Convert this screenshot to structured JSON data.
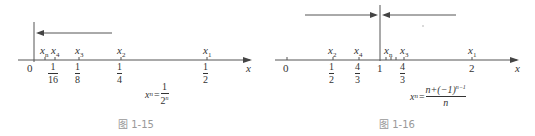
{
  "figures": [
    {
      "id": "fig-1-15",
      "caption": "图 1-15",
      "axis_label": "x",
      "origin_label": "0",
      "points": [
        {
          "name": "x_n",
          "sym": "x",
          "sub": "n"
        },
        {
          "name": "x_4",
          "sym": "x",
          "sub": "4",
          "value_num": "1",
          "value_den": "16"
        },
        {
          "name": "x_3",
          "sym": "x",
          "sub": "3",
          "value_num": "1",
          "value_den": "8"
        },
        {
          "name": "x_2",
          "sym": "x",
          "sub": "2",
          "value_num": "1",
          "value_den": "4"
        },
        {
          "name": "x_1",
          "sym": "x",
          "sub": "1",
          "value_num": "1",
          "value_den": "2"
        }
      ],
      "formula": {
        "lhs": "x",
        "lhs_sub": "n",
        "num": "1",
        "den": "2",
        "den_sup": "n"
      }
    },
    {
      "id": "fig-1-16",
      "caption": "图 1-16",
      "axis_label": "x",
      "origin_label": "0",
      "limit_label": "1",
      "points": [
        {
          "name": "x_2",
          "sym": "x",
          "sub": "2",
          "value_num": "1",
          "value_den": "2"
        },
        {
          "name": "x_4",
          "sym": "x",
          "sub": "4",
          "value_num": "4",
          "value_den": "3"
        },
        {
          "name": "x_n",
          "sym": "x",
          "sub": "n"
        },
        {
          "name": "x_3",
          "sym": "x",
          "sub": "3",
          "value_num": "4",
          "value_den": "3"
        },
        {
          "name": "x_1",
          "sym": "x",
          "sub": "1",
          "value": "2"
        }
      ],
      "formula": {
        "lhs": "x",
        "lhs_sub": "n",
        "num": "n+(−1)",
        "num_sup": "n−1",
        "den": "n"
      }
    }
  ]
}
